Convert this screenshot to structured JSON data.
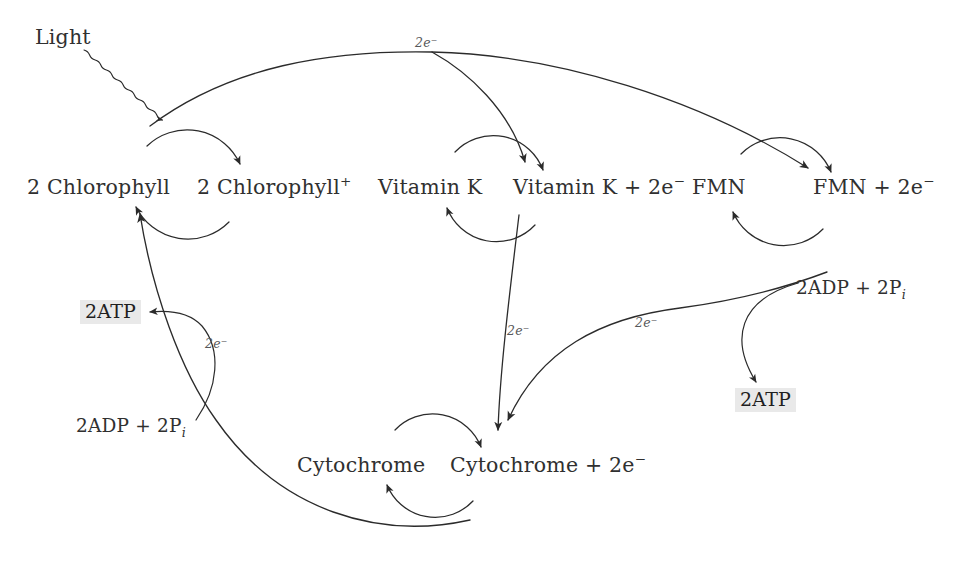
{
  "diagram": {
    "background_color": "#ffffff",
    "stroke_color": "#2b2b2b",
    "highlight_color": "#e9e9e9",
    "text_color": "#303030",
    "electron_label_color": "#57585a"
  },
  "inputs": {
    "light_label": "Light"
  },
  "carriers": {
    "chlorophyll_reduced": "2 Chlorophyll",
    "chlorophyll_oxidized_main": "2 Chlorophyll",
    "chlorophyll_oxidized_charge": "+",
    "vitamin_k_reduced": "Vitamin K",
    "vitamin_k_oxidized_main": "Vitamin K + 2e",
    "vitamin_k_oxidized_charge": "−",
    "fmn_reduced": "FMN",
    "fmn_oxidized_main": "FMN + 2e",
    "fmn_oxidized_charge": "−",
    "cytochrome_reduced": "Cytochrome",
    "cytochrome_oxidized_main": "Cytochrome + 2e",
    "cytochrome_oxidized_charge": "−"
  },
  "electron_labels": {
    "top": "2e⁻",
    "chlorophyll_branch": "2e⁻",
    "vitamin_k_to_cytochrome": "2e⁻",
    "fmn_to_cytochrome": "2e⁻"
  },
  "electron_label_text": {
    "main": "2e",
    "charge": "−"
  },
  "phosphorylation": {
    "left_substrate_main": "2ADP + 2P",
    "left_substrate_sub": "i",
    "left_product": "2ATP",
    "right_substrate_main": "2ADP + 2P",
    "right_substrate_sub": "i",
    "right_product": "2ATP"
  }
}
